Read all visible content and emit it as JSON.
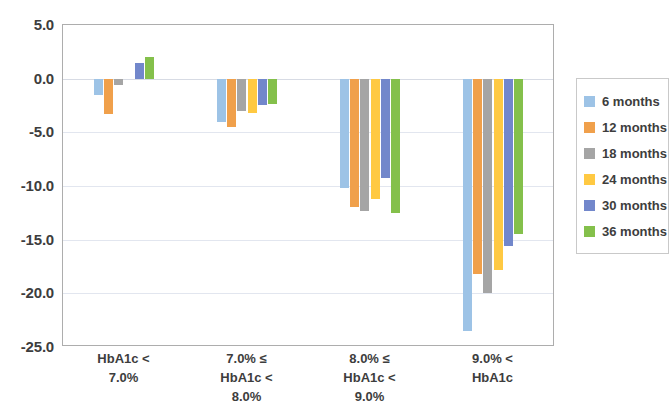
{
  "chart_data": {
    "type": "bar",
    "title": "",
    "subtitle": "",
    "xlabel": "",
    "ylabel": "",
    "ylim": [
      -25.0,
      5.0
    ],
    "grid": true,
    "legend_position": "right",
    "categories": [
      "HbA1c <\n7.0%",
      "7.0% ≤\nHbA1c <\n8.0%",
      "8.0% ≤\nHbA1c <\n9.0%",
      "9.0% <\nHbA1c"
    ],
    "ytick_labels": [
      "5.0",
      "0.0",
      "-5.0",
      "-10.0",
      "-15.0",
      "-20.0",
      "-25.0"
    ],
    "ytick_values": [
      5.0,
      0.0,
      -5.0,
      -10.0,
      -15.0,
      -20.0,
      -25.0
    ],
    "series": [
      {
        "name": "6 months",
        "color": "#9DC3E6",
        "values": [
          -1.5,
          -4.0,
          -10.2,
          -23.5
        ]
      },
      {
        "name": "12 months",
        "color": "#F0A04B",
        "values": [
          -3.3,
          -4.5,
          -12.0,
          -18.2
        ]
      },
      {
        "name": "18 months",
        "color": "#A5A5A5",
        "values": [
          -0.6,
          -3.0,
          -12.3,
          -20.0
        ]
      },
      {
        "name": "24 months",
        "color": "#FFC942",
        "values": [
          0.0,
          -3.2,
          -11.2,
          -17.8
        ]
      },
      {
        "name": "30 months",
        "color": "#7287CB",
        "values": [
          1.5,
          -2.5,
          -9.3,
          -15.6
        ]
      },
      {
        "name": "36 months",
        "color": "#84C04B",
        "values": [
          2.0,
          -2.4,
          -12.5,
          -14.5
        ]
      }
    ]
  },
  "legend": {
    "items": [
      {
        "label": "6 months"
      },
      {
        "label": "12 months"
      },
      {
        "label": "18 months"
      },
      {
        "label": "24 months"
      },
      {
        "label": "30 months"
      },
      {
        "label": "36 months"
      }
    ]
  }
}
